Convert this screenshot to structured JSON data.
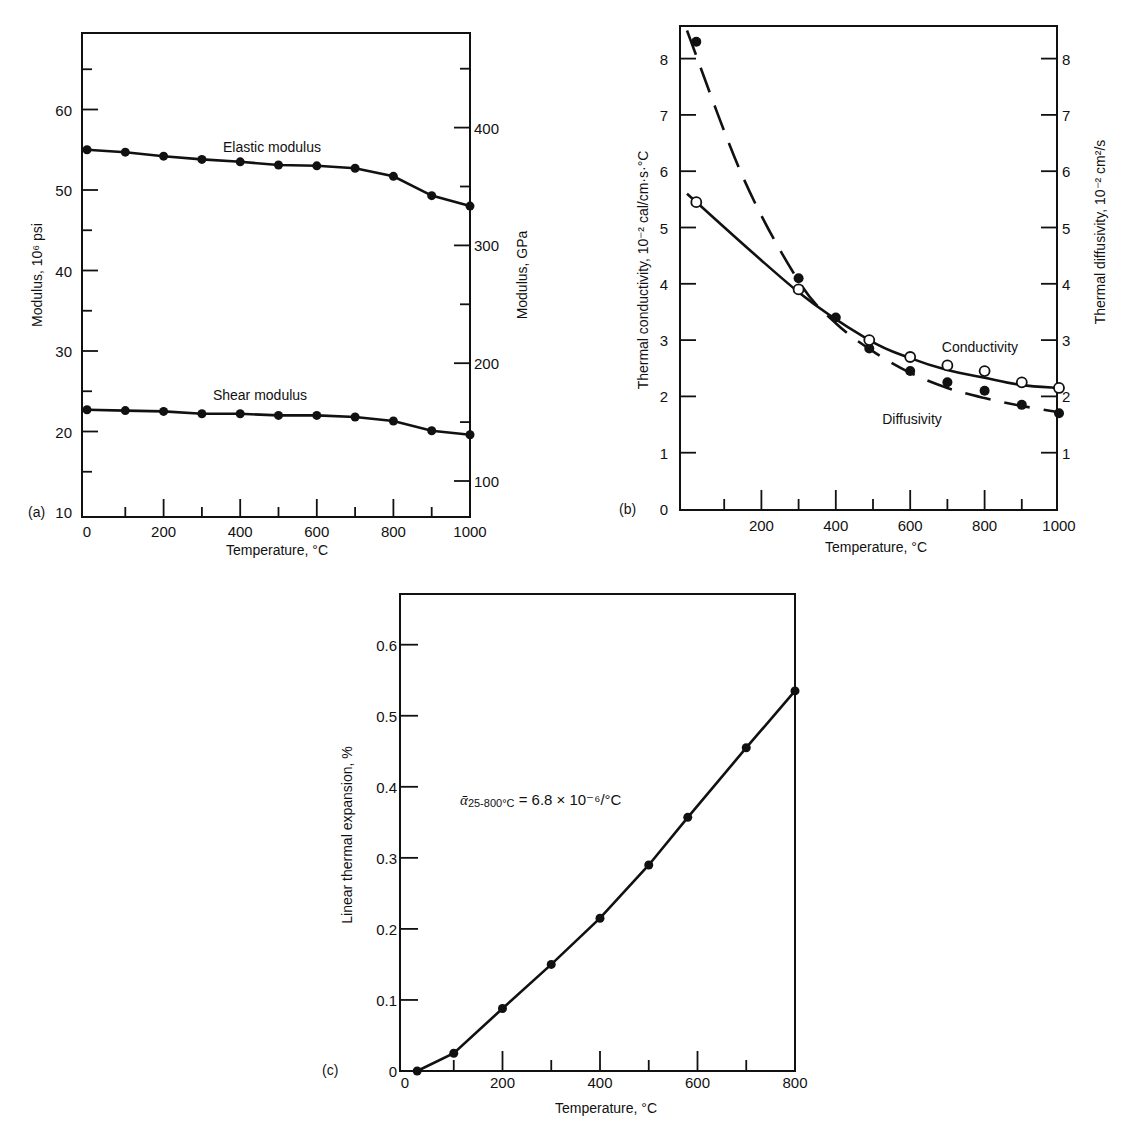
{
  "chart_data": [
    {
      "panel": "(a)",
      "type": "line",
      "xlabel": "Temperature, °C",
      "ylabel": "Modulus, 10⁶ psi",
      "ylabel_right": "Modulus, GPa",
      "x_ticks": [
        "0",
        "200",
        "400",
        "600",
        "800",
        "1000"
      ],
      "y_ticks": [
        "10",
        "20",
        "30",
        "40",
        "50",
        "60"
      ],
      "y_ticks_right": [
        "100",
        "200",
        "300",
        "400"
      ],
      "xlim": [
        0,
        1000
      ],
      "ylim": [
        10,
        70
      ],
      "grid": false,
      "x": [
        0,
        100,
        200,
        300,
        400,
        500,
        600,
        700,
        800,
        900,
        1000
      ],
      "series": [
        {
          "name": "Elastic modulus",
          "values": [
            55.0,
            54.7,
            54.2,
            53.8,
            53.5,
            53.1,
            53.0,
            52.7,
            51.7,
            49.3,
            48.0
          ]
        },
        {
          "name": "Shear modulus",
          "values": [
            22.7,
            22.6,
            22.5,
            22.2,
            22.2,
            22.0,
            22.0,
            21.8,
            21.3,
            20.1,
            19.6
          ]
        }
      ]
    },
    {
      "panel": "(b)",
      "type": "line",
      "xlabel": "Temperature, °C",
      "ylabel": "Thermal conductivity, 10⁻² cal/cm·s·°C",
      "ylabel_right": "Thermal diffusivity, 10⁻² cm²/s",
      "x_ticks": [
        "200",
        "400",
        "600",
        "800",
        "1000"
      ],
      "y_ticks": [
        "0",
        "1",
        "2",
        "3",
        "4",
        "5",
        "6",
        "7",
        "8"
      ],
      "y_ticks_right": [
        "1",
        "2",
        "3",
        "4",
        "5",
        "6",
        "7",
        "8"
      ],
      "xlim": [
        0,
        1000
      ],
      "ylim": [
        0,
        8.5
      ],
      "grid": false,
      "series": [
        {
          "name": "Conductivity",
          "marker": "open-circle",
          "line": "solid",
          "x": [
            25,
            300,
            490,
            600,
            700,
            800,
            900,
            1000
          ],
          "values": [
            5.45,
            3.9,
            3.0,
            2.7,
            2.55,
            2.45,
            2.25,
            2.15
          ]
        },
        {
          "name": "Diffusivity",
          "marker": "filled-circle",
          "line": "dashed",
          "x": [
            25,
            300,
            400,
            490,
            600,
            700,
            800,
            900,
            1000
          ],
          "values": [
            8.3,
            4.1,
            3.4,
            2.85,
            2.45,
            2.25,
            2.1,
            1.85,
            1.7
          ]
        }
      ]
    },
    {
      "panel": "(c)",
      "type": "line",
      "xlabel": "Temperature, °C",
      "ylabel": "Linear thermal expansion, %",
      "x_ticks": [
        "0",
        "200",
        "400",
        "600",
        "800"
      ],
      "y_ticks": [
        "0",
        "0.1",
        "0.2",
        "0.3",
        "0.4",
        "0.5",
        "0.6"
      ],
      "xlim": [
        0,
        800
      ],
      "ylim": [
        0,
        0.67
      ],
      "grid": false,
      "annotation": "ᾱ25-800°C = 6.8 × 10⁻⁶/°C",
      "series": [
        {
          "name": "Linear thermal expansion",
          "x": [
            25,
            100,
            200,
            300,
            400,
            500,
            580,
            700,
            800
          ],
          "values": [
            0.0,
            0.025,
            0.088,
            0.15,
            0.215,
            0.29,
            0.357,
            0.455,
            0.535
          ]
        }
      ]
    }
  ],
  "panels": {
    "a": {
      "label": "(a)",
      "xlabel": "Temperature, °C",
      "ylabel": "Modulus, 10⁶ psi",
      "ylabel_right": "Modulus, GPa",
      "series_labels": [
        "Elastic modulus",
        "Shear modulus"
      ]
    },
    "b": {
      "label": "(b)",
      "xlabel": "Temperature, °C",
      "ylabel": "Thermal conductivity, 10⁻² cal/cm·s·°C",
      "ylabel_right": "Thermal diffusivity, 10⁻² cm²/s",
      "series_labels": [
        "Conductivity",
        "Diffusivity"
      ]
    },
    "c": {
      "label": "(c)",
      "xlabel": "Temperature, °C",
      "ylabel": "Linear thermal expansion, %",
      "annotation_sym": "ᾱ",
      "annotation_sub": "25-800°C",
      "annotation_rest": " = 6.8 × 10⁻⁶/°C"
    }
  }
}
